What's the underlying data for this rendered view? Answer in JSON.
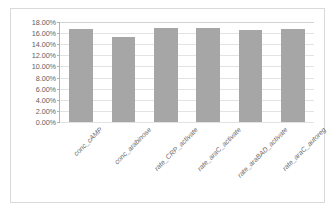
{
  "chart_data": {
    "type": "bar",
    "title": "",
    "xlabel": "",
    "ylabel": "",
    "ylim": [
      0,
      18
    ],
    "ytick_format": "percent",
    "grid": true,
    "legend": false,
    "bar_color": "#a6a6a6",
    "plot_background": "#ffffff",
    "gridline_color": "#e3e3e3",
    "axis_color": "#b3b3b3",
    "frame_color": "#d9d9d9",
    "tick_label_color": "#5f5f5f",
    "category_label_color": "#6a6a6a",
    "category_label_rotation": -45,
    "ytick_labels": [
      "0.00%",
      "2.00%",
      "4.00%",
      "6.00%",
      "8.00%",
      "10.00%",
      "12.00%",
      "14.00%",
      "16.00%",
      "18.00%"
    ],
    "ytick_values": [
      0,
      2,
      4,
      6,
      8,
      10,
      12,
      14,
      16,
      18
    ],
    "categories": [
      "conc_cAMP",
      "conc_arabinose",
      "rate_CRP_activate",
      "rate_araC_activate",
      "rate_araBAD_activate",
      "rate_araC_autoreg"
    ],
    "values": [
      16.7,
      15.3,
      16.9,
      16.9,
      16.6,
      16.7
    ]
  }
}
